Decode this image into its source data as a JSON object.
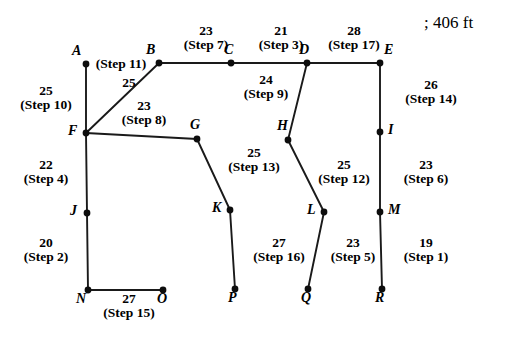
{
  "figure": {
    "corner_note": "; 406 ft",
    "nodes": [
      {
        "id": "A",
        "label": "A",
        "x": 86,
        "y": 64,
        "lx": 72,
        "ly": 44
      },
      {
        "id": "B",
        "label": "B",
        "x": 159,
        "y": 63,
        "lx": 146,
        "ly": 43
      },
      {
        "id": "C",
        "label": "C",
        "x": 231,
        "y": 63,
        "lx": 224,
        "ly": 43
      },
      {
        "id": "D",
        "label": "D",
        "x": 307,
        "y": 63,
        "lx": 299,
        "ly": 43
      },
      {
        "id": "E",
        "label": "E",
        "x": 380,
        "y": 63,
        "lx": 384,
        "ly": 43
      },
      {
        "id": "F",
        "label": "F",
        "x": 86,
        "y": 133,
        "lx": 68,
        "ly": 124
      },
      {
        "id": "G",
        "label": "G",
        "x": 197,
        "y": 139,
        "lx": 190,
        "ly": 118
      },
      {
        "id": "H",
        "label": "H",
        "x": 288,
        "y": 140,
        "lx": 277,
        "ly": 119
      },
      {
        "id": "I",
        "label": "I",
        "x": 380,
        "y": 132,
        "lx": 388,
        "ly": 123
      },
      {
        "id": "J",
        "label": "J",
        "x": 87,
        "y": 213,
        "lx": 70,
        "ly": 204
      },
      {
        "id": "K",
        "label": "K",
        "x": 230,
        "y": 210,
        "lx": 212,
        "ly": 201
      },
      {
        "id": "L",
        "label": "L",
        "x": 324,
        "y": 212,
        "lx": 307,
        "ly": 203
      },
      {
        "id": "M",
        "label": "M",
        "x": 380,
        "y": 212,
        "lx": 388,
        "ly": 203
      },
      {
        "id": "N",
        "label": "N",
        "x": 88,
        "y": 290,
        "lx": 76,
        "ly": 292
      },
      {
        "id": "O",
        "label": "O",
        "x": 163,
        "y": 290,
        "lx": 157,
        "ly": 292
      },
      {
        "id": "P",
        "label": "P",
        "x": 235,
        "y": 289,
        "lx": 228,
        "ly": 291
      },
      {
        "id": "Q",
        "label": "Q",
        "x": 308,
        "y": 289,
        "lx": 301,
        "ly": 291
      },
      {
        "id": "R",
        "label": "R",
        "x": 382,
        "y": 289,
        "lx": 375,
        "ly": 291
      }
    ],
    "edges": [
      {
        "from": "A",
        "to": "F",
        "weight": 25,
        "step": "(Step 10)"
      },
      {
        "from": "F",
        "to": "B",
        "weight": 25,
        "step": "(Step 11)"
      },
      {
        "from": "B",
        "to": "C",
        "weight": 23,
        "step": "(Step 7)"
      },
      {
        "from": "C",
        "to": "D",
        "weight": 21,
        "step": "(Step 3)"
      },
      {
        "from": "D",
        "to": "E",
        "weight": 28,
        "step": "(Step 17)"
      },
      {
        "from": "F",
        "to": "G",
        "weight": 23,
        "step": "(Step 8)"
      },
      {
        "from": "D",
        "to": "H",
        "weight": 24,
        "step": "(Step 9)"
      },
      {
        "from": "E",
        "to": "I",
        "weight": 26,
        "step": "(Step 14)"
      },
      {
        "from": "F",
        "to": "J",
        "weight": 22,
        "step": "(Step 4)"
      },
      {
        "from": "G",
        "to": "K",
        "weight": 25,
        "step": "(Step 13)"
      },
      {
        "from": "H",
        "to": "L",
        "weight": 25,
        "step": "(Step 12)"
      },
      {
        "from": "I",
        "to": "M",
        "weight": 23,
        "step": "(Step 6)"
      },
      {
        "from": "J",
        "to": "N",
        "weight": 20,
        "step": "(Step 2)"
      },
      {
        "from": "N",
        "to": "O",
        "weight": 27,
        "step": "(Step 15)"
      },
      {
        "from": "K",
        "to": "P",
        "weight": 27,
        "step": "(Step 16)"
      },
      {
        "from": "L",
        "to": "Q",
        "weight": 23,
        "step": "(Step 5)"
      },
      {
        "from": "M",
        "to": "R",
        "weight": 19,
        "step": "(Step 1)"
      }
    ],
    "edge_labels": [
      {
        "id": "A-F",
        "num": "25",
        "step": "(Step 10)",
        "x": 8,
        "y": 84,
        "w": 76,
        "stacked": true
      },
      {
        "id": "F-B",
        "num": "25",
        "step": "",
        "x": 112,
        "y": 76,
        "w": 34,
        "stacked": true
      },
      {
        "id": "F-B-step",
        "num": "",
        "step": "(Step 11)",
        "x": 88,
        "y": 57,
        "w": 66,
        "stacked": true
      },
      {
        "id": "B-C",
        "num": "23",
        "step": "(Step 7)",
        "x": 168,
        "y": 24,
        "w": 76,
        "stacked": true
      },
      {
        "id": "C-D",
        "num": "21",
        "step": "(Step 3)",
        "x": 243,
        "y": 24,
        "w": 76,
        "stacked": true
      },
      {
        "id": "D-E",
        "num": "28",
        "step": "(Step 17)",
        "x": 313,
        "y": 24,
        "w": 82,
        "stacked": true
      },
      {
        "id": "F-G",
        "num": "23",
        "step": "(Step 8)",
        "x": 106,
        "y": 99,
        "w": 76,
        "stacked": true
      },
      {
        "id": "D-H",
        "num": "24",
        "step": "(Step 9)",
        "x": 228,
        "y": 73,
        "w": 76,
        "stacked": true
      },
      {
        "id": "E-I",
        "num": "26",
        "step": "(Step 14)",
        "x": 390,
        "y": 78,
        "w": 82,
        "stacked": true
      },
      {
        "id": "F-J",
        "num": "22",
        "step": "(Step 4)",
        "x": 8,
        "y": 158,
        "w": 76,
        "stacked": true
      },
      {
        "id": "G-K",
        "num": "25",
        "step": "(Step 13)",
        "x": 213,
        "y": 146,
        "w": 82,
        "stacked": true
      },
      {
        "id": "H-L",
        "num": "25",
        "step": "(Step 12)",
        "x": 303,
        "y": 158,
        "w": 82,
        "stacked": true
      },
      {
        "id": "I-M",
        "num": "23",
        "step": "(Step 6)",
        "x": 388,
        "y": 158,
        "w": 76,
        "stacked": true
      },
      {
        "id": "J-N",
        "num": "20",
        "step": "(Step 2)",
        "x": 8,
        "y": 236,
        "w": 76,
        "stacked": true
      },
      {
        "id": "K-P",
        "num": "27",
        "step": "(Step 16)",
        "x": 238,
        "y": 236,
        "w": 82,
        "stacked": true
      },
      {
        "id": "L-Q",
        "num": "23",
        "step": "(Step 5)",
        "x": 315,
        "y": 236,
        "w": 76,
        "stacked": true
      },
      {
        "id": "M-R",
        "num": "19",
        "step": "(Step 1)",
        "x": 388,
        "y": 236,
        "w": 76,
        "stacked": true
      },
      {
        "id": "N-O",
        "num": "27",
        "step": "(Step 15)",
        "x": 88,
        "y": 292,
        "w": 82,
        "stacked": true
      }
    ]
  }
}
